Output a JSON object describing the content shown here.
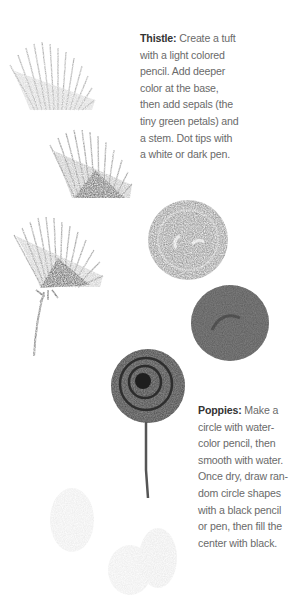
{
  "page": {
    "sections": [
      {
        "id": "thistle",
        "title": "Thistle:",
        "lines": [
          " Create a tuft",
          "with a light colored",
          "pencil. Add deeper",
          "color at the base,",
          "then add sepals (the",
          "tiny green petals) and",
          "a stem. Dot tips with",
          "a white or dark pen."
        ]
      },
      {
        "id": "poppies",
        "title": "Poppies:",
        "lines": [
          " Make a",
          "circle with water-",
          "color pencil, then",
          "smooth with water.",
          "Once dry, draw ran-",
          "dom circle shapes",
          "with a black pencil",
          "or pen, then fill the",
          "center with black."
        ]
      }
    ],
    "illustrations": [
      {
        "name": "thistle-tuft-light",
        "description": "light pencil tuft"
      },
      {
        "name": "thistle-tuft-deeper",
        "description": "tuft with deeper base color"
      },
      {
        "name": "thistle-complete",
        "description": "thistle with sepals and stem"
      },
      {
        "name": "poppy-circle-textured",
        "description": "watercolor pencil circle"
      },
      {
        "name": "poppy-circle-smoothed",
        "description": "circle smoothed with water"
      },
      {
        "name": "poppy-complete",
        "description": "poppy with circle shapes, dark center and stem"
      },
      {
        "name": "poppy-petals-faint",
        "description": "faint petal shapes"
      }
    ]
  }
}
